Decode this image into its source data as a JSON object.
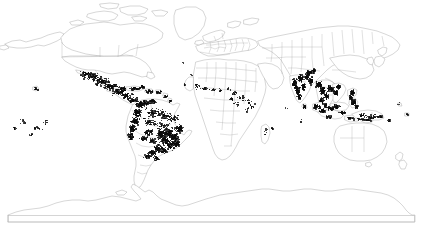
{
  "figure": {
    "kind": "world-distribution-map",
    "projection": "equirectangular",
    "title": "",
    "caption": "",
    "background_color": "#ffffff",
    "coastline_color": "#8a8a8a",
    "border_color": "#9a9a9a",
    "occurrence_color": "#0a0a0a",
    "frame_color": "#b9b9b9",
    "width_px": 423,
    "height_px": 232
  },
  "chart_data": {
    "type": "scatter",
    "title": "",
    "xlabel": "",
    "ylabel": "",
    "xlim": [
      -180,
      180
    ],
    "ylim": [
      -90,
      90
    ],
    "grid": false,
    "legend": null,
    "series": [
      {
        "name": "occurrence records",
        "marker": "filled-square",
        "color": "#0a0a0a",
        "regions": [
          {
            "name": "Mexico and Central America",
            "density": "very-high",
            "count_estimate": 520
          },
          {
            "name": "Caribbean islands",
            "density": "high",
            "count_estimate": 180
          },
          {
            "name": "Northern Andes (Colombia, Ecuador, Peru)",
            "density": "very-high",
            "count_estimate": 430
          },
          {
            "name": "Amazon basin",
            "density": "medium",
            "count_estimate": 260
          },
          {
            "name": "Atlantic Forest, Brazil",
            "density": "very-high",
            "count_estimate": 600
          },
          {
            "name": "Southern Brazil, Paraguay, NE Argentina",
            "density": "high",
            "count_estimate": 220
          },
          {
            "name": "Bolivia eastern lowlands",
            "density": "medium",
            "count_estimate": 120
          },
          {
            "name": "West Africa (Guinea, Ivory Coast, Ghana, Nigeria)",
            "density": "low",
            "count_estimate": 55
          },
          {
            "name": "Central Africa (Cameroon, Gabon, DR Congo)",
            "density": "low",
            "count_estimate": 40
          },
          {
            "name": "East Africa (Kenya, Tanzania, Uganda)",
            "density": "low",
            "count_estimate": 30
          },
          {
            "name": "Madagascar",
            "density": "very-low",
            "count_estimate": 8
          },
          {
            "name": "Indian subcontinent (Western Ghats, NE India)",
            "density": "very-high",
            "count_estimate": 460
          },
          {
            "name": "Sri Lanka",
            "density": "medium",
            "count_estimate": 35
          },
          {
            "name": "Indochina (Myanmar, Thailand, Laos, Vietnam)",
            "density": "very-high",
            "count_estimate": 380
          },
          {
            "name": "Malay Peninsula, Sumatra, Java, Borneo",
            "density": "high",
            "count_estimate": 300
          },
          {
            "name": "Philippines",
            "density": "very-high",
            "count_estimate": 210
          },
          {
            "name": "New Guinea and Solomon Islands",
            "density": "medium",
            "count_estimate": 90
          },
          {
            "name": "Hawaiian Islands",
            "density": "medium",
            "count_estimate": 14
          },
          {
            "name": "Pacific islands (Polynesia, Micronesia, Fiji)",
            "density": "low",
            "count_estimate": 45
          },
          {
            "name": "Indian Ocean islands (Mascarenes, Maldives)",
            "density": "very-low",
            "count_estimate": 10
          },
          {
            "name": "Atlantic islands (Canary, Cape Verde, Azores)",
            "density": "very-low",
            "count_estimate": 9
          }
        ],
        "absent_regions": [
          "Canada and Alaska",
          "Continental United States interior",
          "Greenland",
          "Europe",
          "Russia and Siberia",
          "China, Korea, Japan",
          "Sahara",
          "Australia",
          "New Zealand",
          "Antarctica",
          "Southern Chile and Patagonia"
        ]
      }
    ]
  },
  "map": {
    "landmasses": [
      "North America",
      "South America",
      "Europe",
      "Africa",
      "Asia",
      "Australia",
      "Antarctica",
      "Greenland",
      "Island groups"
    ],
    "features": {
      "country_borders_shown": true,
      "graticule_shown": false,
      "coastlines_shown": true,
      "antarctica_shown": true,
      "bottom_frame_shown": true
    }
  }
}
